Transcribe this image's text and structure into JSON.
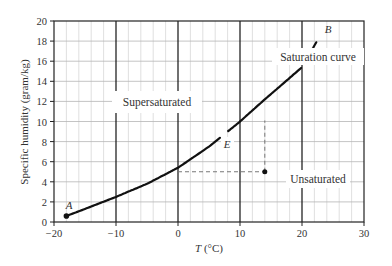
{
  "chart_data": {
    "type": "line",
    "title": "",
    "xlabel": "T (°C)",
    "ylabel": "Specific humidity (gram/kg)",
    "xlim": [
      -20,
      30
    ],
    "ylim": [
      0,
      20
    ],
    "xticks": [
      -20,
      -10,
      0,
      10,
      20,
      30
    ],
    "yticks": [
      0,
      2,
      4,
      6,
      8,
      10,
      12,
      14,
      16,
      18,
      20
    ],
    "grid": true,
    "series": [
      {
        "name": "Saturation curve",
        "x": [
          -18,
          -15,
          -10,
          -5,
          0,
          5,
          10,
          14,
          20,
          22.5
        ],
        "values": [
          0.6,
          1.3,
          2.5,
          3.8,
          5.4,
          7.5,
          10.0,
          12.2,
          15.4,
          18.1
        ]
      }
    ],
    "points": [
      {
        "label": "A",
        "x": -18,
        "y": 0.6
      },
      {
        "label": "B",
        "x": 22.5,
        "y": 18.1
      },
      {
        "label": "E",
        "x": 7.5,
        "y": 8.7
      },
      {
        "label": "",
        "x": 14,
        "y": 5.0
      }
    ],
    "dashed_lines": [
      {
        "from": [
          0,
          5.0
        ],
        "to": [
          14,
          5.0
        ]
      },
      {
        "from": [
          14,
          5.0
        ],
        "to": [
          14,
          10.1
        ]
      }
    ],
    "annotations": [
      "Supersaturated",
      "Unsaturated",
      "Saturation curve",
      "A",
      "B",
      "E"
    ]
  },
  "labels": {
    "ylabel": "Specific humidity (gram/kg)",
    "xlabel_italic": "T",
    "xlabel_rest": " (°C)",
    "supersaturated": "Supersaturated",
    "unsaturated": "Unsaturated",
    "saturation_curve": "Saturation curve",
    "point_a": "A",
    "point_b": "B",
    "point_e": "E"
  },
  "ticks": {
    "x": [
      "−20",
      "−10",
      "0",
      "10",
      "20",
      "30"
    ],
    "y": [
      "0",
      "2",
      "4",
      "6",
      "8",
      "10",
      "12",
      "14",
      "16",
      "18",
      "20"
    ]
  }
}
